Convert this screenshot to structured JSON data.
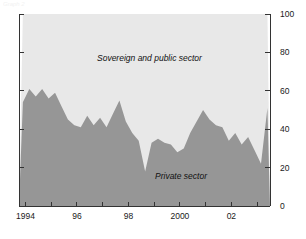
{
  "figure": {
    "caption_fragment": "Graph 2",
    "background": "#ffffff"
  },
  "chart_data": {
    "type": "area",
    "stacked": true,
    "title": "",
    "subtitle": "",
    "xlabel": "",
    "ylabel": "",
    "ylim": [
      0,
      100
    ],
    "xlim": [
      1993.75,
      2003.5
    ],
    "grid": false,
    "legend_position": "inline-annotations",
    "y_ticks": [
      0,
      20,
      40,
      60,
      80,
      100
    ],
    "y_tick_labels": [
      "0",
      "20",
      "40",
      "60",
      "80",
      "100"
    ],
    "y_axis_side": "right",
    "x_ticks": [
      1994,
      1995,
      1996,
      1997,
      1998,
      1999,
      2000,
      2001,
      2002,
      2003
    ],
    "x_tick_labels": [
      "1994",
      "",
      "96",
      "",
      "98",
      "",
      "2000",
      "",
      "02",
      ""
    ],
    "colors": {
      "private_sector": "#969696",
      "sovereign_and_public_sector": "#e8e8e8",
      "axis": "#333333",
      "text": "#111111"
    },
    "annotations": [
      {
        "text": "Sovereign and public sector",
        "x": 1997.2,
        "y": 80,
        "style": "italic"
      },
      {
        "text": "Private sector",
        "x": 1999.8,
        "y": 20,
        "style": "italic"
      }
    ],
    "x": [
      1993.9,
      1994.15,
      1994.4,
      1994.65,
      1994.9,
      1995.15,
      1995.4,
      1995.65,
      1995.9,
      1996.15,
      1996.4,
      1996.65,
      1996.9,
      1997.15,
      1997.4,
      1997.65,
      1997.9,
      1998.15,
      1998.4,
      1998.65,
      1998.9,
      1999.15,
      1999.4,
      1999.65,
      1999.9,
      2000.15,
      2000.4,
      2000.65,
      2000.9,
      2001.15,
      2001.4,
      2001.65,
      2001.9,
      2002.15,
      2002.4,
      2002.65,
      2002.9,
      2003.15,
      2003.4
    ],
    "series": [
      {
        "name": "Private sector",
        "color": "#969696",
        "values": [
          54,
          61,
          57,
          61,
          56,
          59,
          52,
          45,
          42,
          41,
          47,
          42,
          46,
          41,
          48,
          55,
          44,
          38,
          34,
          18,
          33,
          35,
          33,
          32,
          28,
          30,
          38,
          44,
          50,
          45,
          42,
          41,
          34,
          38,
          32,
          36,
          29,
          22,
          51
        ]
      },
      {
        "name": "Sovereign and public sector",
        "color": "#e8e8e8",
        "values": [
          46,
          39,
          43,
          39,
          44,
          41,
          48,
          55,
          58,
          59,
          53,
          58,
          54,
          59,
          52,
          45,
          56,
          62,
          66,
          82,
          67,
          65,
          67,
          68,
          72,
          70,
          62,
          56,
          50,
          55,
          58,
          59,
          66,
          62,
          68,
          64,
          71,
          78,
          49
        ]
      }
    ]
  }
}
